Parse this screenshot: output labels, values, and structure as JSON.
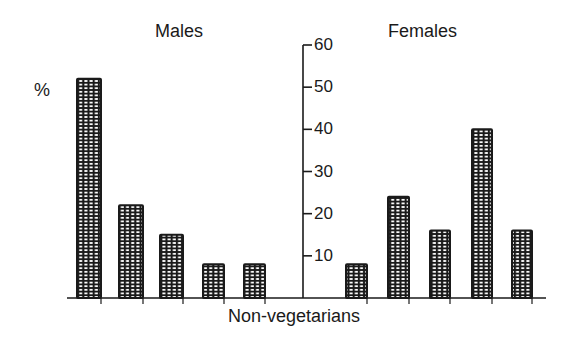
{
  "chart_data": {
    "type": "bar",
    "title": "",
    "xlabel": "Non-vegetarians",
    "ylabel": "%",
    "ylim": [
      0,
      60
    ],
    "yticks": [
      10,
      20,
      30,
      40,
      50,
      60
    ],
    "grid": false,
    "legend": "none",
    "panel_titles": [
      "Males",
      "Females"
    ],
    "categories": [
      "1",
      "2",
      "3",
      "4",
      "5"
    ],
    "series": [
      {
        "name": "Males",
        "values": [
          52,
          22,
          15,
          8,
          8
        ]
      },
      {
        "name": "Females",
        "values": [
          8,
          24,
          16,
          40,
          16
        ]
      }
    ],
    "bar_pattern": "cross-hatched grid",
    "colors": {
      "ink": "#1a1a1a",
      "background": "#ffffff"
    }
  },
  "labels": {
    "males_title": "Males",
    "females_title": "Females",
    "y_unit": "%",
    "x_axis_label": "Non-vegetarians"
  }
}
